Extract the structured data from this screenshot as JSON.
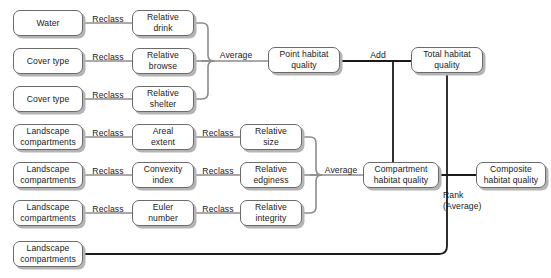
{
  "diagram": {
    "colors": {
      "box_border": "#6b6b6b",
      "box_shadow": "#b4b4b4",
      "edge_light": "#8c8c8c",
      "edge_dark": "#1a1a1a",
      "background": "#ffffff",
      "text": "#1a1a1a"
    },
    "nodes": [
      {
        "id": "water",
        "label": "Water",
        "x": 13,
        "y": 10,
        "w": 70,
        "h": 26
      },
      {
        "id": "cover_type_1",
        "label": "Cover type",
        "x": 13,
        "y": 48,
        "w": 70,
        "h": 26
      },
      {
        "id": "cover_type_2",
        "label": "Cover type",
        "x": 13,
        "y": 86,
        "w": 70,
        "h": 26
      },
      {
        "id": "landscape_1",
        "label": "Landscape\ncompartments",
        "x": 13,
        "y": 124,
        "w": 70,
        "h": 26
      },
      {
        "id": "landscape_2",
        "label": "Landscape\ncompartments",
        "x": 13,
        "y": 162,
        "w": 70,
        "h": 26
      },
      {
        "id": "landscape_3",
        "label": "Landscape\ncompartments",
        "x": 13,
        "y": 200,
        "w": 70,
        "h": 26
      },
      {
        "id": "landscape_4",
        "label": "Landscape\ncompartments",
        "x": 13,
        "y": 241,
        "w": 70,
        "h": 26
      },
      {
        "id": "relative_drink",
        "label": "Relative\ndrink",
        "x": 132,
        "y": 10,
        "w": 62,
        "h": 26
      },
      {
        "id": "relative_browse",
        "label": "Relative\nbrowse",
        "x": 132,
        "y": 48,
        "w": 62,
        "h": 26
      },
      {
        "id": "relative_shelter",
        "label": "Relative\nshelter",
        "x": 132,
        "y": 86,
        "w": 62,
        "h": 26
      },
      {
        "id": "areal_extent",
        "label": "Areal\nextent",
        "x": 132,
        "y": 124,
        "w": 62,
        "h": 26
      },
      {
        "id": "convexity_index",
        "label": "Convexity\nindex",
        "x": 132,
        "y": 162,
        "w": 62,
        "h": 26
      },
      {
        "id": "euler_number",
        "label": "Euler\nnumber",
        "x": 132,
        "y": 200,
        "w": 62,
        "h": 26
      },
      {
        "id": "relative_size",
        "label": "Relative\nsize",
        "x": 240,
        "y": 124,
        "w": 62,
        "h": 26
      },
      {
        "id": "relative_edginess",
        "label": "Relative\nedginess",
        "x": 240,
        "y": 162,
        "w": 62,
        "h": 26
      },
      {
        "id": "relative_integrity",
        "label": "Relative\nintegrity",
        "x": 240,
        "y": 200,
        "w": 62,
        "h": 26
      },
      {
        "id": "point_habitat",
        "label": "Point habitat\nquality",
        "x": 268,
        "y": 47,
        "w": 72,
        "h": 26
      },
      {
        "id": "total_habitat",
        "label": "Total habitat\nquality",
        "x": 411,
        "y": 47,
        "w": 72,
        "h": 26
      },
      {
        "id": "compartment_habitat",
        "label": "Compartment\nhabitat quality",
        "x": 363,
        "y": 162,
        "w": 76,
        "h": 26
      },
      {
        "id": "composite_habitat",
        "label": "Composite\nhabitat quality",
        "x": 476,
        "y": 162,
        "w": 70,
        "h": 26
      }
    ],
    "edge_labels": [
      {
        "id": "reclass_1",
        "label": "Reclass",
        "x": 87,
        "y": 14,
        "w": 42
      },
      {
        "id": "reclass_2",
        "label": "Reclass",
        "x": 87,
        "y": 52,
        "w": 42
      },
      {
        "id": "reclass_3",
        "label": "Reclass",
        "x": 87,
        "y": 90,
        "w": 42
      },
      {
        "id": "reclass_4",
        "label": "Reclass",
        "x": 87,
        "y": 128,
        "w": 42
      },
      {
        "id": "reclass_5",
        "label": "Reclass",
        "x": 87,
        "y": 166,
        "w": 42
      },
      {
        "id": "reclass_6",
        "label": "Reclass",
        "x": 87,
        "y": 204,
        "w": 42
      },
      {
        "id": "reclass_7",
        "label": "Reclass",
        "x": 197,
        "y": 128,
        "w": 42
      },
      {
        "id": "reclass_8",
        "label": "Reclass",
        "x": 197,
        "y": 166,
        "w": 42
      },
      {
        "id": "reclass_9",
        "label": "Reclass",
        "x": 197,
        "y": 204,
        "w": 42
      },
      {
        "id": "average_1",
        "label": "Average",
        "x": 213,
        "y": 50,
        "w": 46
      },
      {
        "id": "average_2",
        "label": "Average",
        "x": 318,
        "y": 165,
        "w": 46
      },
      {
        "id": "add_1",
        "label": "Add",
        "x": 363,
        "y": 50,
        "w": 30
      },
      {
        "id": "rank_1",
        "label": "Rank\n(Average)",
        "x": 443,
        "y": 190,
        "w": 50
      }
    ]
  }
}
